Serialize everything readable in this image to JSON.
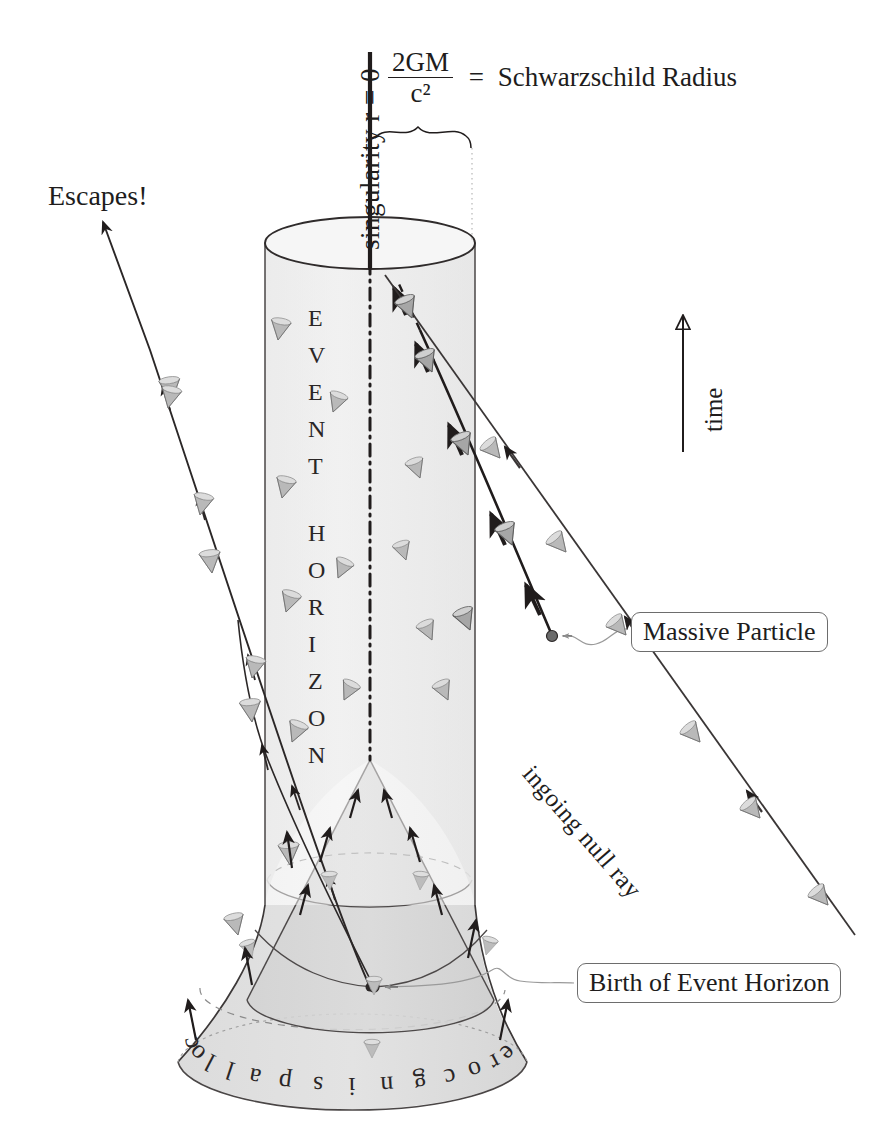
{
  "figure": {
    "background_color": "#ffffff",
    "ink_color": "#201c1c",
    "shade_color": "#e2e2e2",
    "cone_fill": "#d8d8d8"
  },
  "labels": {
    "singularity": "singularity  r = 0",
    "formula_numerator": "2GM",
    "formula_denominator": "c²",
    "equals": "=",
    "schwarzschild": "Schwarzschild Radius",
    "escapes": "Escapes!",
    "time_axis": "time",
    "massive_particle": "Massive Particle",
    "ingoing_null_ray": "ingoing null ray",
    "birth_of_event_horizon": "Birth of Event Horizon",
    "collapsing_core": "collapsing core",
    "event_horizon_letters": [
      "E",
      "V",
      "E",
      "N",
      "T",
      "H",
      "O",
      "R",
      "I",
      "Z",
      "O",
      "N"
    ],
    "collapsing_core_letters": [
      "c",
      "o",
      "l",
      "l",
      "a",
      "p",
      "s",
      "i",
      "n",
      "g",
      "c",
      "o",
      "r",
      "e"
    ]
  },
  "geometry": {
    "cylinder": {
      "cx": 370,
      "rx": 105,
      "ry": 26,
      "top_y": 243,
      "bottom_y": 905
    },
    "singularity_line": {
      "x": 370,
      "y_top": 52,
      "y_bottom": 268
    },
    "brace": {
      "x_left": 375,
      "x_right": 472,
      "y": 130
    },
    "dotted_drop": {
      "x": 472,
      "y_top": 140,
      "y_bottom": 243
    },
    "center_dashdot": {
      "x": 370,
      "y_top": 258,
      "y_bottom": 760
    },
    "inner_cone_apex": {
      "x": 370,
      "y": 760
    },
    "birth_event": {
      "x": 374,
      "y": 987
    },
    "core_base_ellipse": {
      "cx": 352,
      "cy": 1065,
      "rx": 175,
      "ry": 52
    },
    "time_arrow": {
      "x": 683,
      "y_top": 310,
      "y_bottom": 452
    }
  },
  "elements": {
    "light_cone_count": 34,
    "escape_trajectory": "null ray escaping to upper-left before horizon forms",
    "particle_worldline": "massive particle worldline crossing the horizon"
  },
  "caption": ""
}
